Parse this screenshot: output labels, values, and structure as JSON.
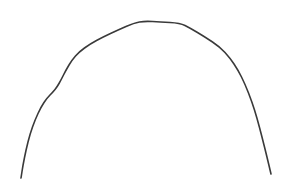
{
  "drawing": {
    "description": "hand-drawn arch curve",
    "background": "#ffffff",
    "stroke_color": "#3a3a3a",
    "stroke_width": 1.6,
    "points": [
      [
        21,
        178
      ],
      [
        23,
        165
      ],
      [
        26,
        150
      ],
      [
        30,
        134
      ],
      [
        35,
        120
      ],
      [
        41,
        107
      ],
      [
        47,
        98
      ],
      [
        53,
        92
      ],
      [
        57,
        87
      ],
      [
        61,
        80
      ],
      [
        66,
        70
      ],
      [
        72,
        60
      ],
      [
        79,
        52
      ],
      [
        90,
        44
      ],
      [
        103,
        37
      ],
      [
        118,
        30
      ],
      [
        134,
        23
      ],
      [
        145,
        21
      ],
      [
        160,
        22
      ],
      [
        180,
        23
      ],
      [
        190,
        28
      ],
      [
        205,
        37
      ],
      [
        220,
        47
      ],
      [
        230,
        58
      ],
      [
        238,
        70
      ],
      [
        245,
        84
      ],
      [
        252,
        102
      ],
      [
        257,
        118
      ],
      [
        262,
        137
      ],
      [
        267,
        157
      ],
      [
        271,
        174
      ]
    ]
  }
}
